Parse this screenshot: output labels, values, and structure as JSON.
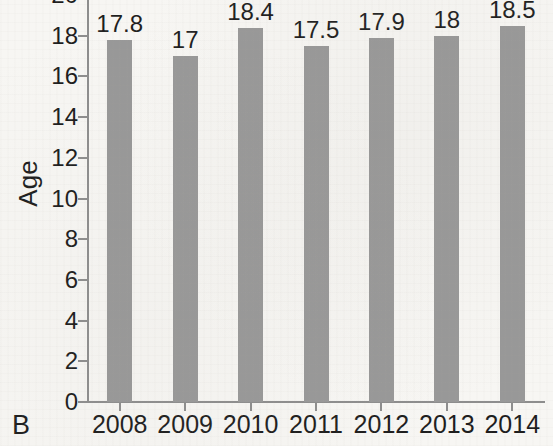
{
  "panel": {
    "label": "B"
  },
  "axes": {
    "y_title": "Age",
    "y_ticks": [
      0,
      2,
      4,
      6,
      8,
      10,
      12,
      14,
      16,
      18,
      20
    ],
    "y_tick_labels": [
      "0",
      "2",
      "4",
      "6",
      "8",
      "10",
      "12",
      "14",
      "16",
      "18",
      "20"
    ],
    "x_tick_labels": [
      "2008",
      "2009",
      "2010",
      "2011",
      "2012",
      "2013",
      "2014"
    ]
  },
  "style": {
    "bar_color": "#989898",
    "axis_color": "#8d8d8d",
    "text_color": "#1d1d1d",
    "background_color": "#f7f6f3"
  },
  "chart_data": {
    "type": "bar",
    "title": "",
    "subtitle": "",
    "xlabel": "",
    "ylabel": "Age",
    "categories": [
      "2008",
      "2009",
      "2010",
      "2011",
      "2012",
      "2013",
      "2014"
    ],
    "values": [
      17.8,
      17,
      18.4,
      17.5,
      17.9,
      18,
      18.5
    ],
    "data_labels": [
      "17.8",
      "17",
      "18.4",
      "17.5",
      "17.9",
      "18",
      "18.5"
    ],
    "ylim": [
      0,
      20
    ],
    "ytick_step": 2,
    "grid": false,
    "legend": "none",
    "panel_letter": "B"
  }
}
